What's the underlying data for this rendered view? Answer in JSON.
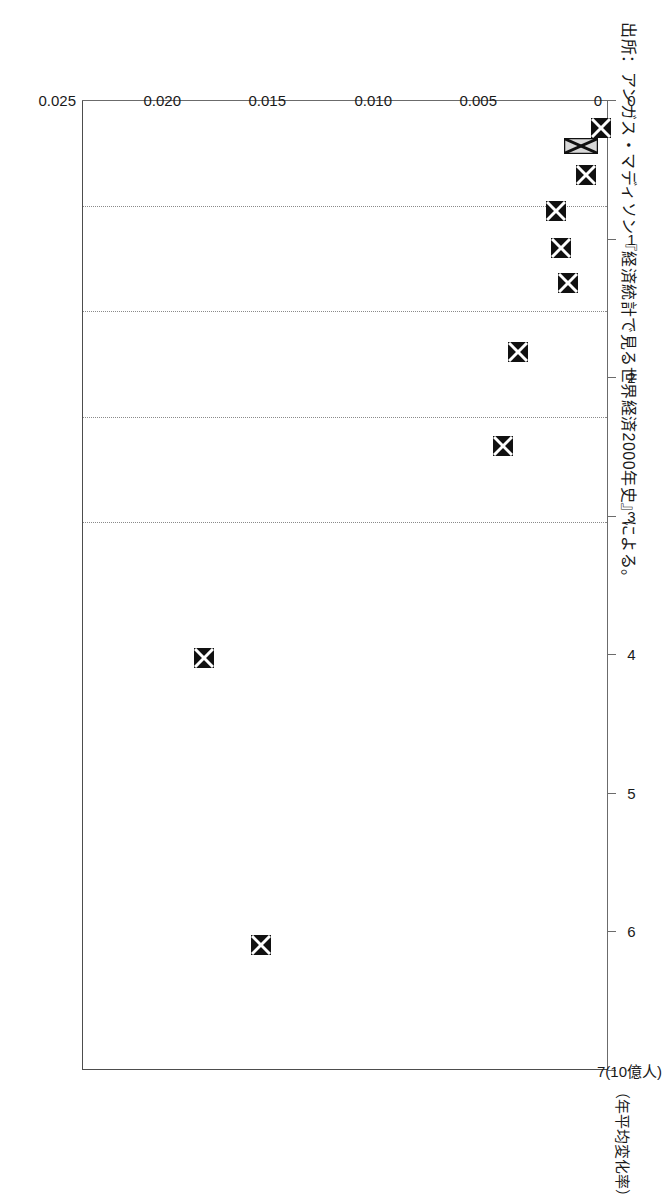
{
  "figure": {
    "orientation_note": "page-rotated-90",
    "source_note": "出所：アンガス・マディソン『経済統計で見る世界経済2000年史』による。",
    "background_color": "#ffffff",
    "frame_color": "#4d4d4d",
    "gridline_color": "#8a8a8a",
    "marker_color": "#111111",
    "marker_highlight_color": "#d9d9d9"
  },
  "chart_data": {
    "type": "scatter",
    "title": "",
    "subtitle": "",
    "xlabel": "7(10億人)",
    "ylabel": "（年平均変化率）",
    "xlim": [
      0,
      7
    ],
    "ylim": [
      0,
      0.025
    ],
    "grid": true,
    "grid_axis": "y",
    "legend": "none",
    "xticks": [
      0,
      1,
      2,
      3,
      4,
      5,
      6,
      7
    ],
    "xticklabels": [
      "0",
      "1",
      "2",
      "3",
      "4",
      "5",
      "6",
      "7"
    ],
    "yticks": [
      0,
      0.005,
      0.01,
      0.015,
      0.02,
      0.025
    ],
    "yticklabels": [
      "0",
      "0.005",
      "0.010",
      "0.015",
      "0.020",
      "0.025"
    ],
    "x_unit_label": "(10億人)",
    "series": [
      {
        "name": "世界人口と年平均変化率",
        "marker": "square-x",
        "points": [
          {
            "x": 0.2,
            "y": 0.00035,
            "style": "solid"
          },
          {
            "x": 0.33,
            "y": 0.0013,
            "style": "hatched"
          },
          {
            "x": 0.54,
            "y": 0.00105,
            "style": "solid"
          },
          {
            "x": 0.8,
            "y": 0.00245,
            "style": "solid"
          },
          {
            "x": 1.07,
            "y": 0.00225,
            "style": "solid"
          },
          {
            "x": 1.32,
            "y": 0.0019,
            "style": "solid"
          },
          {
            "x": 1.82,
            "y": 0.0043,
            "style": "solid"
          },
          {
            "x": 2.5,
            "y": 0.005,
            "style": "solid"
          },
          {
            "x": 4.03,
            "y": 0.0192,
            "style": "solid"
          },
          {
            "x": 6.1,
            "y": 0.0165,
            "style": "solid"
          }
        ]
      }
    ]
  }
}
